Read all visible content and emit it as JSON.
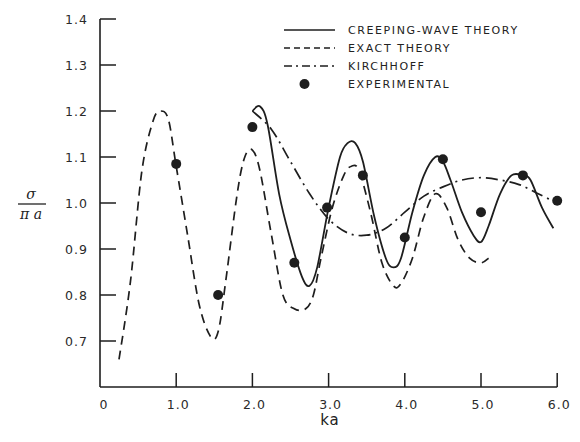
{
  "chart_data": {
    "type": "line",
    "title": "",
    "xlabel": "ka",
    "ylabel": "σ / πa",
    "ylabel_numerator": "σ",
    "ylabel_denominator": "π a",
    "xlim": [
      0,
      6.0
    ],
    "ylim": [
      0.6,
      1.4
    ],
    "grid": false,
    "legend_position": "upper right",
    "x_ticks": [
      "0",
      "1.0",
      "2.0",
      "3.0",
      "4.0",
      "5.0",
      "6.0"
    ],
    "x_tick_values": [
      0,
      1,
      2,
      3,
      4,
      5,
      6
    ],
    "y_ticks": [
      "0.7",
      "0.8",
      "0.9",
      "1.0",
      "1.1",
      "1.2",
      "1.3",
      "1.4"
    ],
    "y_tick_values": [
      0.7,
      0.8,
      0.9,
      1.0,
      1.1,
      1.2,
      1.3,
      1.4
    ],
    "series": [
      {
        "name": "CREEPING-WAVE THEORY",
        "style": "solid",
        "x": [
          2.0,
          2.1,
          2.2,
          2.35,
          2.5,
          2.65,
          2.75,
          2.85,
          3.0,
          3.15,
          3.25,
          3.35,
          3.45,
          3.6,
          3.75,
          3.85,
          3.95,
          4.1,
          4.25,
          4.4,
          4.5,
          4.6,
          4.75,
          4.9,
          5.0,
          5.1,
          5.25,
          5.4,
          5.55,
          5.65,
          5.8,
          5.95
        ],
        "y": [
          1.2,
          1.21,
          1.17,
          1.02,
          0.92,
          0.84,
          0.82,
          0.86,
          0.99,
          1.1,
          1.13,
          1.13,
          1.09,
          0.97,
          0.88,
          0.86,
          0.88,
          0.98,
          1.06,
          1.1,
          1.09,
          1.05,
          0.98,
          0.93,
          0.915,
          0.95,
          1.02,
          1.06,
          1.06,
          1.05,
          0.99,
          0.945
        ]
      },
      {
        "name": "EXACT THEORY",
        "style": "dashed",
        "x": [
          0.25,
          0.4,
          0.55,
          0.7,
          0.8,
          0.9,
          1.0,
          1.15,
          1.3,
          1.45,
          1.55,
          1.65,
          1.8,
          1.9,
          2.0,
          2.1,
          2.25,
          2.4,
          2.55,
          2.7,
          2.8,
          2.9,
          3.05,
          3.2,
          3.3,
          3.4,
          3.55,
          3.7,
          3.85,
          3.95,
          4.1,
          4.25,
          4.4,
          4.55,
          4.7,
          4.85,
          5.0,
          5.1
        ],
        "y": [
          0.66,
          0.83,
          1.07,
          1.18,
          1.2,
          1.18,
          1.08,
          0.93,
          0.78,
          0.71,
          0.72,
          0.83,
          1.02,
          1.1,
          1.115,
          1.07,
          0.93,
          0.8,
          0.77,
          0.77,
          0.8,
          0.88,
          0.99,
          1.06,
          1.08,
          1.07,
          0.98,
          0.87,
          0.82,
          0.825,
          0.88,
          0.97,
          1.02,
          0.99,
          0.92,
          0.88,
          0.87,
          0.88
        ]
      },
      {
        "name": "KIRCHHOFF",
        "style": "dashdot",
        "x": [
          2.0,
          2.25,
          2.5,
          2.75,
          3.0,
          3.25,
          3.5,
          3.75,
          4.0,
          4.25,
          4.5,
          4.75,
          5.0,
          5.25,
          5.5,
          5.75,
          6.0
        ],
        "y": [
          1.2,
          1.16,
          1.09,
          1.02,
          0.965,
          0.935,
          0.93,
          0.945,
          0.98,
          1.015,
          1.035,
          1.05,
          1.055,
          1.05,
          1.04,
          1.02,
          1.0
        ]
      },
      {
        "name": "EXPERIMENTAL",
        "style": "points",
        "x": [
          1.0,
          1.55,
          2.0,
          2.55,
          2.98,
          3.45,
          4.0,
          4.5,
          5.0,
          5.55,
          6.0
        ],
        "y": [
          1.085,
          0.8,
          1.165,
          0.87,
          0.99,
          1.06,
          0.925,
          1.095,
          0.98,
          1.06,
          1.005
        ]
      }
    ]
  },
  "legend": {
    "items": [
      {
        "label": "CREEPING-WAVE THEORY",
        "style": "solid"
      },
      {
        "label": "EXACT THEORY",
        "style": "dashed"
      },
      {
        "label": "KIRCHHOFF",
        "style": "dashdot"
      },
      {
        "label": "EXPERIMENTAL",
        "style": "points"
      }
    ]
  },
  "colors": {
    "ink": "#1e1e1e",
    "background": "#ffffff"
  }
}
